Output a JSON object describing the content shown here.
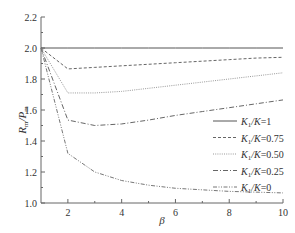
{
  "chart_data": {
    "type": "line",
    "title": "",
    "xlabel": "β",
    "ylabel": "R_m/P_m",
    "xlim": [
      1,
      10
    ],
    "ylim": [
      1.0,
      2.2
    ],
    "xticks": [
      2,
      4,
      6,
      8,
      10
    ],
    "yticks": [
      1.0,
      1.2,
      1.4,
      1.6,
      1.8,
      2.0,
      2.2
    ],
    "grid": false,
    "legend_position": "lower right",
    "series": [
      {
        "name": "K1/K=1",
        "label_main": "K",
        "label_sub": "1",
        "label_rest": "/K=1",
        "style": "solid",
        "x": [
          1,
          2,
          3,
          4,
          5,
          6,
          7,
          8,
          9,
          10
        ],
        "y": [
          2.0,
          2.0,
          2.0,
          2.0,
          2.0,
          2.0,
          2.0,
          2.0,
          2.0,
          2.0
        ]
      },
      {
        "name": "K1/K=0.75",
        "label_main": "K",
        "label_sub": "1",
        "label_rest": "/K=0.75",
        "style": "dashed",
        "x": [
          1,
          2,
          3,
          4,
          5,
          6,
          7,
          8,
          9,
          10
        ],
        "y": [
          2.0,
          1.865,
          1.875,
          1.885,
          1.895,
          1.905,
          1.915,
          1.925,
          1.935,
          1.94
        ]
      },
      {
        "name": "K1/K=0.50",
        "label_main": "K",
        "label_sub": "1",
        "label_rest": "/K=0.50",
        "style": "dotted",
        "x": [
          1,
          2,
          3,
          4,
          5,
          6,
          7,
          8,
          9,
          10
        ],
        "y": [
          2.0,
          1.71,
          1.71,
          1.72,
          1.74,
          1.76,
          1.78,
          1.8,
          1.82,
          1.84
        ]
      },
      {
        "name": "K1/K=0.25",
        "label_main": "K",
        "label_sub": "1",
        "label_rest": "/K=0.25",
        "style": "dashdot",
        "x": [
          1,
          2,
          3,
          4,
          5,
          6,
          7,
          8,
          9,
          10
        ],
        "y": [
          2.0,
          1.535,
          1.5,
          1.51,
          1.535,
          1.565,
          1.59,
          1.615,
          1.64,
          1.665
        ]
      },
      {
        "name": "K1/K=0",
        "label_main": "K",
        "label_sub": "1",
        "label_rest": "/K=0",
        "style": "dashdotdot",
        "x": [
          1,
          2,
          3,
          4,
          5,
          6,
          7,
          8,
          9,
          10
        ],
        "y": [
          2.0,
          1.32,
          1.2,
          1.145,
          1.115,
          1.095,
          1.085,
          1.075,
          1.07,
          1.065
        ]
      }
    ]
  }
}
